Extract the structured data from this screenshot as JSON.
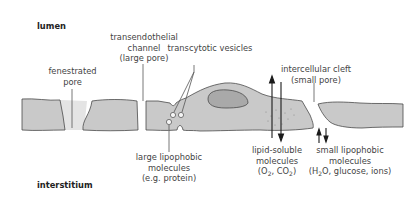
{
  "regions": {
    "top": "lumen",
    "bottom": "interstitium"
  },
  "labels": {
    "fenestrated_pore": [
      "fenestrated",
      "pore"
    ],
    "transendothelial_channel": [
      "transendothelial",
      "channel",
      "(large pore)"
    ],
    "transcytotic_vesicles": [
      "transcytotic vesicles"
    ],
    "intercellular_cleft": [
      "intercellular cleft",
      "(small pore)"
    ],
    "large_lipophobic": [
      "large lipophobic",
      "molecules",
      "(e.g. protein)"
    ],
    "lipid_soluble": [
      "lipid-soluble",
      "molecules"
    ],
    "lipid_soluble_examples": {
      "pre": "(O",
      "sub1": "2",
      "mid": ", CO",
      "sub2": "2",
      "post": ")"
    },
    "small_lipophobic": [
      "small lipophobic",
      "molecules"
    ],
    "small_lipophobic_examples": {
      "pre": "(H",
      "sub1": "2",
      "post": "O, glucose, ions)"
    }
  },
  "colors": {
    "cell_fill": "#c9c9c9",
    "nucleus_fill": "#a9a9a9",
    "pore_fill": "#e4e4e4",
    "outline": "#4a4a4a",
    "arrow": "#1a1a1a",
    "leader_line": "#555555"
  }
}
